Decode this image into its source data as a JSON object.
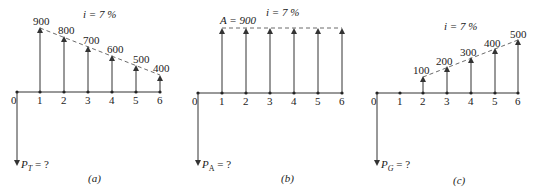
{
  "panels": [
    {
      "id": "a",
      "caption": "(a)",
      "rate": "i = 7 %",
      "pv_label": "P",
      "pv_sub": "T",
      "pv_rest": " = ?",
      "periods": [
        "0",
        "1",
        "2",
        "3",
        "4",
        "5",
        "6"
      ],
      "cash_flows": [
        {
          "period": 1,
          "label": "900"
        },
        {
          "period": 2,
          "label": "800"
        },
        {
          "period": 3,
          "label": "700"
        },
        {
          "period": 4,
          "label": "600"
        },
        {
          "period": 5,
          "label": "500"
        },
        {
          "period": 6,
          "label": "400"
        }
      ]
    },
    {
      "id": "b",
      "caption": "(b)",
      "rate": "i = 7 %",
      "annuity_label": "A = 900",
      "pv_label": "P",
      "pv_sub": "A",
      "pv_rest": " = ?",
      "periods": [
        "0",
        "1",
        "2",
        "3",
        "4",
        "5",
        "6"
      ],
      "cash_flows": [
        {
          "period": 1,
          "value": 900
        },
        {
          "period": 2,
          "value": 900
        },
        {
          "period": 3,
          "value": 900
        },
        {
          "period": 4,
          "value": 900
        },
        {
          "period": 5,
          "value": 900
        },
        {
          "period": 6,
          "value": 900
        }
      ]
    },
    {
      "id": "c",
      "caption": "(c)",
      "rate": "i = 7 %",
      "pv_label": "P",
      "pv_sub": "G",
      "pv_rest": " = ?",
      "periods": [
        "0",
        "1",
        "2",
        "3",
        "4",
        "5",
        "6"
      ],
      "cash_flows": [
        {
          "period": 2,
          "label": "100"
        },
        {
          "period": 3,
          "label": "200"
        },
        {
          "period": 4,
          "label": "300"
        },
        {
          "period": 5,
          "label": "400"
        },
        {
          "period": 6,
          "label": "500"
        }
      ]
    }
  ]
}
